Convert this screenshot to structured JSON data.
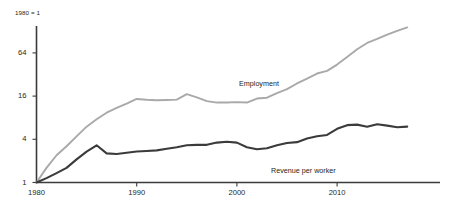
{
  "chart_data": {
    "type": "line",
    "title": "",
    "subtitle": "",
    "index_note": "1980 = 1",
    "xlabel": "",
    "ylabel": "",
    "yscale": "log",
    "log_base": 4,
    "ylim": [
      1,
      160
    ],
    "xlim": [
      1980,
      2017
    ],
    "grid": false,
    "legend_position": "inline-annotation",
    "y_ticks": [
      {
        "value": 64,
        "label": "64"
      },
      {
        "value": 16,
        "label": "16"
      },
      {
        "value": 4,
        "label": "4"
      },
      {
        "value": 1,
        "label": "1"
      }
    ],
    "x_ticks": [
      {
        "value": 1980,
        "label": "1980"
      },
      {
        "value": 1990,
        "label": "1990"
      },
      {
        "value": 2000,
        "label": "2000"
      },
      {
        "value": 2010,
        "label": "2010"
      }
    ],
    "x": [
      1980,
      1981,
      1982,
      1983,
      1984,
      1985,
      1986,
      1987,
      1988,
      1989,
      1990,
      1991,
      1992,
      1993,
      1994,
      1995,
      1996,
      1997,
      1998,
      1999,
      2000,
      2001,
      2002,
      2003,
      2004,
      2005,
      2006,
      2007,
      2008,
      2009,
      2010,
      2011,
      2012,
      2013,
      2014,
      2015,
      2016,
      2017
    ],
    "series": [
      {
        "name": "Employment",
        "color": "#a9a9a9",
        "label": "Employment",
        "values": [
          1.0,
          1.6,
          2.4,
          3.2,
          4.4,
          6.0,
          7.6,
          9.4,
          11.0,
          12.6,
          14.6,
          14.2,
          14.0,
          14.1,
          14.3,
          17.0,
          15.4,
          13.6,
          13.0,
          13.0,
          13.2,
          13.0,
          14.8,
          15.2,
          17.6,
          20.0,
          24.0,
          28.0,
          33.0,
          36.0,
          44.0,
          56.0,
          72.0,
          88.0,
          100.0,
          115.0,
          130.0,
          145.0
        ]
      },
      {
        "name": "Revenue per worker",
        "color": "#3b3b3b",
        "label": "Revenue per worker",
        "values": [
          1.0,
          1.15,
          1.35,
          1.6,
          2.1,
          2.7,
          3.3,
          2.55,
          2.5,
          2.6,
          2.7,
          2.75,
          2.8,
          2.95,
          3.1,
          3.3,
          3.35,
          3.35,
          3.6,
          3.7,
          3.6,
          3.1,
          2.9,
          3.0,
          3.3,
          3.55,
          3.65,
          4.1,
          4.4,
          4.6,
          5.6,
          6.3,
          6.4,
          6.0,
          6.5,
          6.2,
          5.9,
          6.0
        ]
      }
    ]
  }
}
